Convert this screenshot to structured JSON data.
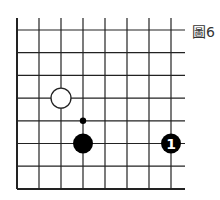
{
  "figure": {
    "label": "圖6",
    "board": {
      "columns": 8,
      "rows": 8,
      "origin_x": 17,
      "origin_y": 30,
      "spacing_x": 22,
      "spacing_y": 22.7,
      "right_edge_x": 185,
      "top_edge_y": 18
    },
    "stones": [
      {
        "color": "white",
        "col": 2,
        "row": 3,
        "label": ""
      },
      {
        "color": "black",
        "col": 3,
        "row": 5,
        "label": ""
      },
      {
        "color": "black",
        "col": 7,
        "row": 5,
        "label": "1"
      }
    ],
    "markers": [
      {
        "type": "dot",
        "col": 3,
        "row": 4
      }
    ],
    "colors": {
      "line": "#222222",
      "black_stone": "#000000",
      "white_stone": "#ffffff",
      "stone_number": "#ffffff"
    }
  }
}
